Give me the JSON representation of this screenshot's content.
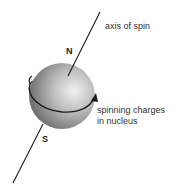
{
  "labels": {
    "axis": "axis of spin",
    "north": "N",
    "south": "S",
    "charges_line1": "spinning charges",
    "charges_line2": "in nucleus"
  },
  "colors": {
    "sphere_light": "#ececec",
    "sphere_dark": "#6e6e6e",
    "line": "#1a1a1a"
  }
}
